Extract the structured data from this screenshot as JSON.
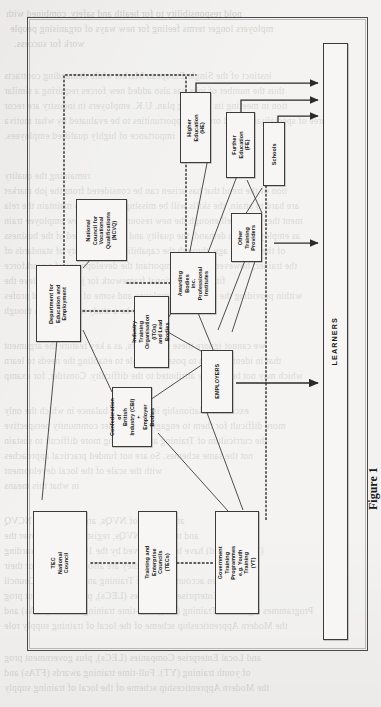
{
  "document": {
    "type": "scanned-book-page",
    "orientation": "figure-rotated-90ccw",
    "caption": "Figure 1"
  },
  "diagram": {
    "terminal": {
      "label": "LEARNERS"
    },
    "nodes": [
      {
        "id": "he",
        "label": "Higher\nEducation (HE)"
      },
      {
        "id": "fe",
        "label": "Further\nEducation (FE)"
      },
      {
        "id": "schools",
        "label": "Schools"
      },
      {
        "id": "ncvq",
        "label": "National\nCouncil for\nVocational\nQualifications\n(NCVQ)"
      },
      {
        "id": "awarding",
        "label": "Awarding Bodies\ninc.\nProfessional\nInstitutes"
      },
      {
        "id": "otherprov",
        "label": "Other\nTraining\nProviders"
      },
      {
        "id": "dfee",
        "label": "Department for\nEducation and\nEmployment"
      },
      {
        "id": "itos",
        "label": "Industry Training\nOrganisation (ITOs)\nand Lead Bodies"
      },
      {
        "id": "employers",
        "label": "EMPLOYERS"
      },
      {
        "id": "cbi",
        "label": "Confederation of\nBritish Industry (CBI)\n+\nEmployer Bodies"
      },
      {
        "id": "tec",
        "label": "TEC\nNational\nCouncil"
      },
      {
        "id": "tecs",
        "label": "Training and\nEnterprise Councils\n(TECs)"
      },
      {
        "id": "gtp",
        "label": "Government Training\nProgrammes\ne.g. Youth Training\n(YT)"
      }
    ],
    "edges": [
      {
        "from": "he",
        "to": "learners",
        "style": "solid-arrow"
      },
      {
        "from": "fe",
        "to": "learners",
        "style": "solid-arrow"
      },
      {
        "from": "schools",
        "to": "learners",
        "style": "solid-arrow"
      },
      {
        "from": "otherprov",
        "to": "learners",
        "style": "solid-arrow"
      },
      {
        "from": "employers",
        "to": "learners",
        "style": "solid-arrow"
      },
      {
        "from": "ncvq",
        "to": "awarding",
        "style": "dotted"
      },
      {
        "from": "tec",
        "to": "tecs",
        "style": "dotted"
      },
      {
        "from": "tecs",
        "to": "gtp",
        "style": "dotted"
      },
      {
        "from": "dfee",
        "to": "itos",
        "style": "dotted"
      },
      {
        "from": "dfee",
        "to": "he",
        "style": "dotted"
      },
      {
        "from": "dfee",
        "to": "ncvq",
        "style": "thin"
      },
      {
        "from": "dfee",
        "to": "cbi",
        "style": "thin"
      },
      {
        "from": "dfee",
        "to": "tec",
        "style": "thin"
      },
      {
        "from": "awarding",
        "to": "he",
        "style": "thin"
      },
      {
        "from": "awarding",
        "to": "fe",
        "style": "thin"
      },
      {
        "from": "awarding",
        "to": "itos",
        "style": "thin"
      },
      {
        "from": "awarding",
        "to": "employers",
        "style": "thin"
      },
      {
        "from": "schools",
        "to": "otherprov",
        "style": "thin"
      },
      {
        "from": "itos",
        "to": "employers",
        "style": "thin"
      },
      {
        "from": "cbi",
        "to": "employers",
        "style": "thin"
      },
      {
        "from": "employers",
        "to": "gtp",
        "style": "thin"
      },
      {
        "from": "otherprov",
        "to": "gtp",
        "style": "thin"
      },
      {
        "from": "schools",
        "to": "gtp",
        "style": "dotted"
      }
    ]
  },
  "bleed_text": {
    "top": [
      "nold responsibility to for health and safety, combined with",
      "mployers longer terms feeling for new ways of organising people",
      "work for success."
    ],
    "body": [
      "instinct of the Single European Market while demanding contracts",
      "thus the number of jobs has also added new forces requiring a similar",
      "tion in meeting its Training plan. U.K. employers in industry are recor",
      "aree of specialisation and order of opportunities to be evaluated by what motiva",
      "importance of highly qualified employees.",
      "",
      "remaining the quality",
      "tion of the trend that has arisen can be considered from the job market",
      "are hard to attain, the skills will be missing early and to maintain the rela",
      "ment they have well enough the new resources. In the new employee train",
      "as employers also demand, the quality and skills expected of the business",
      "of the present age, through the capability and capacity of standards of",
      "the trainer; however, it is also important the development of a workforce",
      "fit into the national framework for jobs. To achieve the",
      "within providing the individual employee and some of training and profes",
      "must be a study method even though",
      "",
      "we cannot ignore these statements, as a key feature the argument",
      "that in identification to possibility role to enabling the needs to learn",
      "which may not be directly attributed to the difficulty. Consider, for examp",
      "",
      "excellent relationship is a sense of balance in which the only",
      "more difficult for them to engage in the wider community perspective",
      "the curriculum of Training are becoming more difficult to sustain",
      "not the same schemes. So are not funded practical approaches",
      "with the scale of the local development",
      "in what this means",
      "",
      "at the level of NVQs, are awarded by NCVQ",
      "and to deliver NVQs, registered NCVQ over the",
      "(Type-related) have been approved by the 100 training awarding",
      "they are also lead bodies for their",
      "given accountability of Training and Enterprise Council",
      "Enterprise Companies (LECs), plus government prog",
      "Programmes e.g. Youth Training (YT), Full-time training awards (FTAs) and",
      "the Modern Apprenticeship scheme of the local of training supply role"
    ],
    "bottom": [
      "and Local Enterprise Companies (LECs), plus government prog",
      "of youth training (YT). Full-time training awards (FTAs) and",
      "the Modern Apprenticeship scheme of the local of training supply"
    ]
  }
}
